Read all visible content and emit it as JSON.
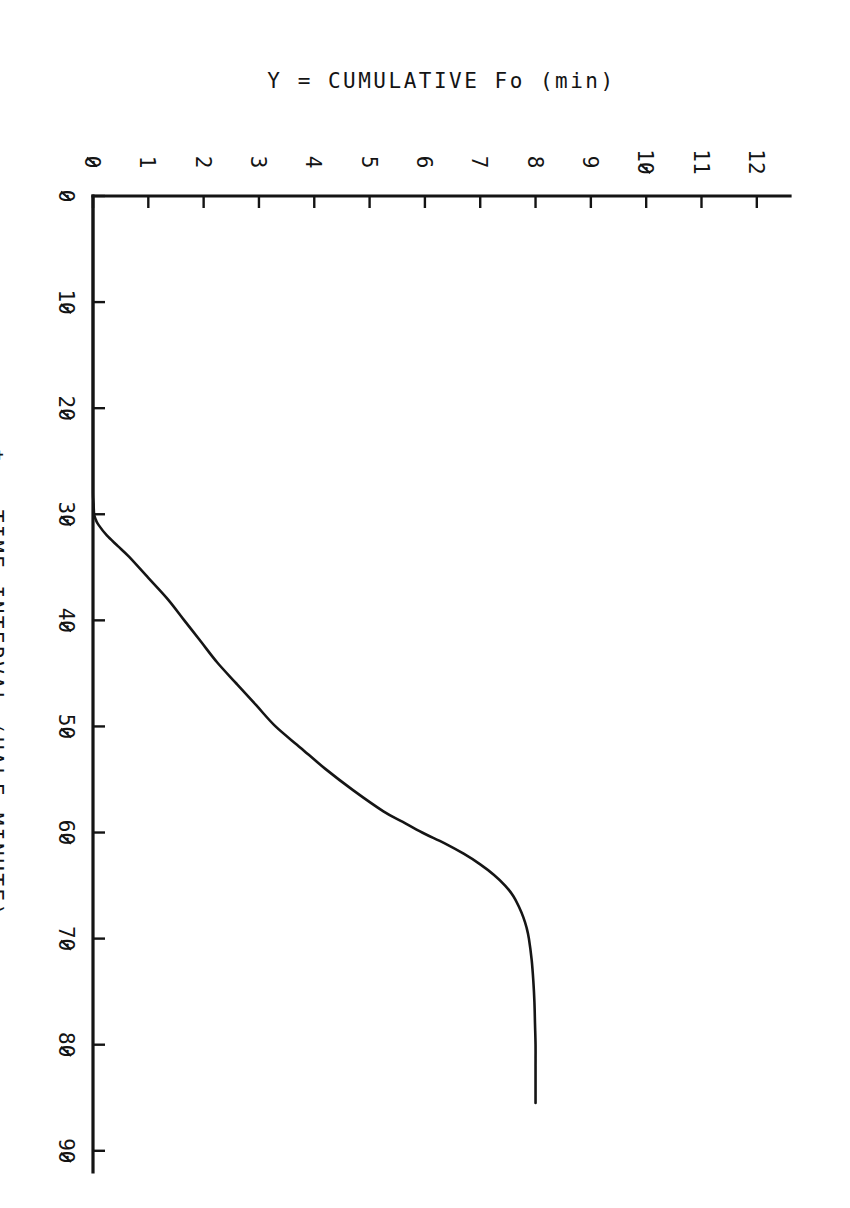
{
  "figure": {
    "orientation": "rotated-90-clockwise",
    "background_color": "#ffffff",
    "ink_color": "#141414"
  },
  "chart_data": {
    "type": "line",
    "title": "",
    "subtitle": "",
    "xlabel": "t = TIME INTERVAL (HALF MINUTE)",
    "ylabel": "Y = CUMULATIVE Fo (min)",
    "xlim": [
      0,
      92
    ],
    "ylim": [
      0,
      12.6
    ],
    "xticks": [
      0,
      10,
      20,
      30,
      40,
      50,
      60,
      70,
      80,
      90
    ],
    "xticklabels": [
      "0",
      "10",
      "20",
      "30",
      "40",
      "50",
      "60",
      "70",
      "80",
      "90"
    ],
    "yticks": [
      0,
      1,
      2,
      3,
      4,
      5,
      6,
      7,
      8,
      9,
      10,
      11,
      12
    ],
    "yticklabels": [
      "0",
      "1",
      "2",
      "3",
      "4",
      "5",
      "6",
      "7",
      "8",
      "9",
      "10",
      "11",
      "12"
    ],
    "grid": false,
    "legend": null,
    "legend_position": "none",
    "zero_glyph": "slashed",
    "series": [
      {
        "name": "Cumulative Fo",
        "color": "#151515",
        "x": [
          0,
          5,
          10,
          15,
          20,
          25,
          28,
          29,
          30,
          30.5,
          31,
          32,
          33,
          34,
          36,
          38,
          40,
          42,
          44,
          46,
          48,
          50,
          52,
          54,
          56,
          58,
          59,
          60,
          61,
          62,
          63,
          64,
          65,
          66,
          67,
          68,
          69,
          70,
          72,
          74,
          76,
          78,
          80,
          82,
          84,
          85,
          85.5
        ],
        "y": [
          0,
          0,
          0,
          0,
          0,
          0,
          0,
          0.01,
          0.02,
          0.05,
          0.1,
          0.25,
          0.45,
          0.65,
          1.0,
          1.35,
          1.65,
          1.95,
          2.25,
          2.6,
          2.95,
          3.3,
          3.75,
          4.2,
          4.7,
          5.25,
          5.6,
          5.95,
          6.35,
          6.7,
          7.0,
          7.25,
          7.45,
          7.6,
          7.7,
          7.78,
          7.84,
          7.88,
          7.93,
          7.96,
          7.98,
          7.99,
          8.0,
          8.0,
          8.0,
          8.0,
          8.0
        ]
      }
    ],
    "annotations": []
  },
  "x_axis": {
    "label": "t = TIME INTERVAL (HALF MINUTE)",
    "ticks": [
      "0",
      "10",
      "20",
      "30",
      "40",
      "50",
      "60",
      "70",
      "80",
      "90"
    ]
  },
  "y_axis": {
    "label": "Y = CUMULATIVE Fo (min)",
    "ticks": [
      "0",
      "1",
      "2",
      "3",
      "4",
      "5",
      "6",
      "7",
      "8",
      "9",
      "10",
      "11",
      "12"
    ]
  }
}
